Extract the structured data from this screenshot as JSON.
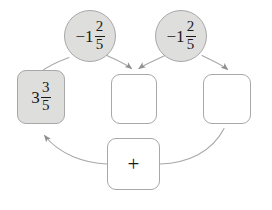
{
  "diagram": {
    "type": "mixed-number-addition-flow",
    "stroke_color": "#a8a8a8",
    "fill_shaded": "#dededd",
    "fill_empty": "#ffffff",
    "text_color": "#1a1a1a",
    "background": "#ffffff"
  },
  "nodes": {
    "addend_left": {
      "shape": "circle",
      "shaded": true,
      "sign": "−1",
      "numerator": "2",
      "denominator": "5",
      "full_text": "−1 2/5"
    },
    "addend_right": {
      "shape": "circle",
      "shaded": true,
      "sign": "−1",
      "numerator": "2",
      "denominator": "5",
      "full_text": "−1 2/5"
    },
    "result_box": {
      "shape": "rounded-square",
      "shaded": true,
      "whole": "3",
      "numerator": "3",
      "denominator": "5",
      "full_text": "3 3/5"
    },
    "slot_middle": {
      "shape": "rounded-square",
      "shaded": false,
      "value": ""
    },
    "slot_right": {
      "shape": "rounded-square",
      "shaded": false,
      "value": ""
    },
    "operator_box": {
      "shape": "rounded-square",
      "shaded": false,
      "symbol": "+"
    }
  },
  "connectors": [
    {
      "name": "left-circle-to-result",
      "from": "addend_left",
      "to": "result_box",
      "arrowhead": false
    },
    {
      "name": "left-circle-to-middle-slot",
      "from": "addend_left",
      "to": "slot_middle",
      "arrowhead": true
    },
    {
      "name": "right-circle-to-middle-slot",
      "from": "addend_right",
      "to": "slot_middle",
      "arrowhead": true
    },
    {
      "name": "right-circle-to-right-slot",
      "from": "addend_right",
      "to": "slot_right",
      "arrowhead": true
    },
    {
      "name": "operator-to-result",
      "from": "operator_box",
      "to": "result_box",
      "arrowhead": true
    },
    {
      "name": "right-slot-to-operator",
      "from": "slot_right",
      "to": "operator_box",
      "arrowhead": false
    }
  ]
}
